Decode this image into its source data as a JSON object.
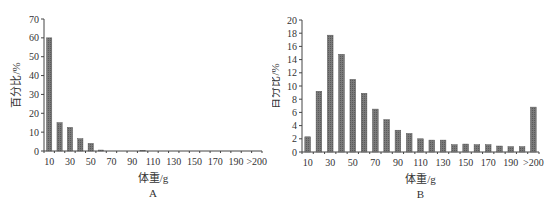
{
  "chart_data": [
    {
      "type": "bar",
      "panel_label": "A",
      "title": "",
      "xlabel": "体重/g",
      "ylabel": "百分比/%",
      "ylim": [
        0,
        70
      ],
      "yticks": [
        0,
        10,
        20,
        30,
        40,
        50,
        60,
        70
      ],
      "xtick_labels": [
        "10",
        "30",
        "50",
        "70",
        "90",
        "110",
        "130",
        "150",
        "170",
        "190",
        ">200"
      ],
      "categories": [
        "10",
        "20",
        "30",
        "40",
        "50",
        "60",
        "70",
        "80",
        "90",
        "100",
        "110",
        "120",
        "130",
        "140",
        "150",
        "160",
        "170",
        "180",
        "190",
        "200",
        ">200"
      ],
      "values": [
        60,
        15,
        12.5,
        6.5,
        4,
        0.5,
        0,
        0,
        0,
        0.3,
        0,
        0,
        0,
        0,
        0,
        0,
        0,
        0,
        0,
        0,
        0
      ],
      "grid": false,
      "legend": null
    },
    {
      "type": "bar",
      "panel_label": "B",
      "title": "",
      "xlabel": "体重/g",
      "ylabel": "百分比/%",
      "ylim": [
        0,
        20
      ],
      "yticks": [
        0,
        2,
        4,
        6,
        8,
        10,
        12,
        14,
        16,
        18,
        20
      ],
      "xtick_labels": [
        "10",
        "30",
        "50",
        "70",
        "90",
        "110",
        "130",
        "150",
        "170",
        "190",
        ">200"
      ],
      "categories": [
        "10",
        "20",
        "30",
        "40",
        "50",
        "60",
        "70",
        "80",
        "90",
        "100",
        "110",
        "120",
        "130",
        "140",
        "150",
        "160",
        "170",
        "180",
        "190",
        "200",
        ">200"
      ],
      "values": [
        2.3,
        9.2,
        17.7,
        14.8,
        11.0,
        8.9,
        6.5,
        4.9,
        3.3,
        2.8,
        2.0,
        1.8,
        1.8,
        1.1,
        1.2,
        1.1,
        1.1,
        0.9,
        0.8,
        0.8,
        6.8
      ],
      "grid": false,
      "legend": null
    }
  ],
  "style": {
    "bar_color": "#7a7a7a",
    "bar_hatch_color": "#5a5a5a",
    "axis_color": "#444444"
  }
}
